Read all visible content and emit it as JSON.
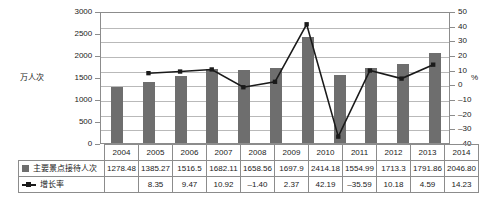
{
  "chart_data": {
    "type": "bar",
    "title": "",
    "xlabel": "",
    "ylabel": "万人次",
    "y2label": "%",
    "categories": [
      "2004",
      "2005",
      "2006",
      "2007",
      "2008",
      "2009",
      "2010",
      "2011",
      "2012",
      "2013",
      "2014"
    ],
    "ylim": [
      0,
      3000
    ],
    "y2lim": [
      -40,
      50
    ],
    "yticks": [
      "3000",
      "2500",
      "2000",
      "1500",
      "1000",
      "500",
      "0"
    ],
    "y2ticks": [
      "50",
      "40",
      "30",
      "20",
      "10",
      "0",
      "-10",
      "-20",
      "-30",
      "-40"
    ],
    "grid": true,
    "legend_position": "table-left",
    "series": [
      {
        "name": "主要景点接待人次",
        "type": "bar",
        "axis": "left",
        "color": "#6e6e6e",
        "values": [
          1278.48,
          1385.27,
          1516.5,
          1682.11,
          1658.56,
          1697.9,
          2414.18,
          1554.99,
          1713.3,
          1791.86,
          2046.8
        ],
        "labels": [
          "1278.48",
          "1385.27",
          "1516.5",
          "1682.11",
          "1658.56",
          "1697.9",
          "2414.18",
          "1554.99",
          "1713.3",
          "1791.86",
          "2046.80"
        ]
      },
      {
        "name": "增长率",
        "type": "line",
        "axis": "right",
        "color": "#1a1a1a",
        "values": [
          null,
          8.35,
          9.47,
          10.92,
          -1.4,
          2.37,
          42.19,
          -35.59,
          10.18,
          4.59,
          14.23
        ],
        "labels": [
          "",
          "8.35",
          "9.47",
          "10.92",
          "-1.40",
          "2.37",
          "42.19",
          "-35.59",
          "10.18",
          "4.59",
          "14.23"
        ]
      }
    ]
  },
  "table": {
    "row_labels": [
      "主要景点接待人次",
      "增长率"
    ]
  }
}
